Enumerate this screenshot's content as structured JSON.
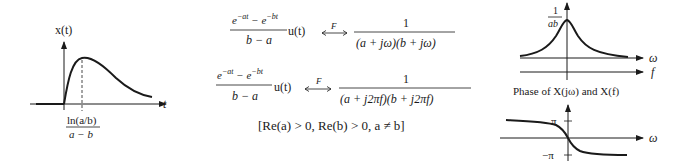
{
  "left_plot": {
    "y_label": "x(t)",
    "x_label": "t",
    "peak_label_numerator": "ln(a/b)",
    "peak_label_denominator": "a − b"
  },
  "pairs": [
    {
      "lhs_numerator": "e^{−at} − e^{−bt}",
      "lhs_denominator": "b − a",
      "lhs_suffix": "u(t)",
      "operator": "F",
      "rhs_numerator": "1",
      "rhs_denominator": "(a + jω)(b + jω)"
    },
    {
      "lhs_numerator": "e^{−at} − e^{−bt}",
      "lhs_denominator": "b − a",
      "lhs_suffix": "u(t)",
      "operator": "F",
      "rhs_numerator": "1",
      "rhs_denominator": "(a + j2πf)(b + j2πf)"
    }
  ],
  "condition": "[Re(a) > 0, Re(b) > 0, a ≠ b]",
  "magnitude_plot": {
    "peak_label_numerator": "1",
    "peak_label_denominator": "ab",
    "axis1_label": "ω",
    "axis2_label": "f"
  },
  "phase_plot": {
    "title": "Phase of X(jω) and X(f)",
    "upper_tick": "π",
    "lower_tick": "−π",
    "axis_label": "ω"
  }
}
